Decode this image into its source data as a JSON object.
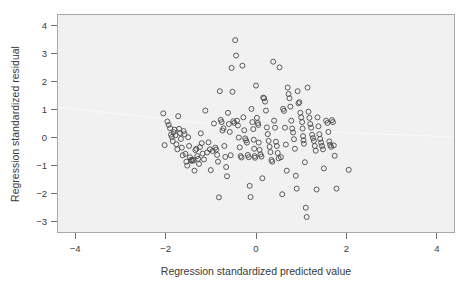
{
  "chart_data": {
    "type": "scatter",
    "title": "",
    "subtitle": "",
    "xlabel": "Regression standardized predicted value",
    "ylabel": "Regression standardized residual",
    "xlim": [
      -4.4,
      4.4
    ],
    "ylim": [
      -3.4,
      4.4
    ],
    "xticks": [
      -4,
      -2,
      0,
      2,
      4
    ],
    "xtick_labels": [
      "−4",
      "−2",
      "0",
      "2",
      "4"
    ],
    "yticks": [
      -3,
      -2,
      -1,
      0,
      1,
      2,
      3,
      4
    ],
    "ytick_labels": [
      "−3",
      "−2",
      "−1",
      "0",
      "1",
      "2",
      "3",
      "4"
    ],
    "grid": false,
    "legend": null,
    "marker": "open-circle",
    "marker_size": 5,
    "plot_background": "#f1f1f1",
    "marker_color": "#4a4a4a",
    "frame_color": "#a8a8a8",
    "n_points": 184,
    "points": [
      [
        -2.05,
        0.86
      ],
      [
        -2.02,
        -0.27
      ],
      [
        -1.96,
        0.57
      ],
      [
        -1.93,
        0.45
      ],
      [
        -1.9,
        0.33
      ],
      [
        -1.88,
        0.1
      ],
      [
        -1.86,
        0.02
      ],
      [
        -1.84,
        -0.13
      ],
      [
        -1.82,
        0.19
      ],
      [
        -1.8,
        0.28
      ],
      [
        -1.78,
        0.08
      ],
      [
        -1.76,
        -0.24
      ],
      [
        -1.74,
        -0.42
      ],
      [
        -1.72,
        0.76
      ],
      [
        -1.7,
        0.31
      ],
      [
        -1.68,
        0.16
      ],
      [
        -1.66,
        -0.05
      ],
      [
        -1.64,
        -0.36
      ],
      [
        -1.62,
        -0.63
      ],
      [
        -1.6,
        0.23
      ],
      [
        -1.58,
        0.12
      ],
      [
        -1.56,
        -0.58
      ],
      [
        -1.54,
        -0.86
      ],
      [
        -1.52,
        -1.0
      ],
      [
        -1.5,
        0.01
      ],
      [
        -1.48,
        -0.3
      ],
      [
        -1.46,
        -0.7
      ],
      [
        -1.44,
        -0.8
      ],
      [
        -1.42,
        -0.83
      ],
      [
        -1.4,
        -0.79
      ],
      [
        -1.38,
        -0.82
      ],
      [
        -1.36,
        -1.18
      ],
      [
        -1.34,
        -0.45
      ],
      [
        -1.32,
        -0.4
      ],
      [
        -1.3,
        -0.66
      ],
      [
        -1.28,
        -0.76
      ],
      [
        -1.26,
        -0.94
      ],
      [
        -1.24,
        -0.34
      ],
      [
        -1.22,
        0.15
      ],
      [
        -1.2,
        -0.2
      ],
      [
        -1.18,
        -0.57
      ],
      [
        -1.15,
        -0.78
      ],
      [
        -1.12,
        0.96
      ],
      [
        -1.08,
        -0.53
      ],
      [
        -1.05,
        -0.17
      ],
      [
        -1.02,
        -0.42
      ],
      [
        -1.0,
        -1.16
      ],
      [
        -0.96,
        -0.48
      ],
      [
        -0.93,
        0.5
      ],
      [
        -0.9,
        -0.36
      ],
      [
        -0.88,
        -0.43
      ],
      [
        -0.86,
        -0.62
      ],
      [
        -0.84,
        -0.86
      ],
      [
        -0.82,
        -2.13
      ],
      [
        -0.8,
        1.65
      ],
      [
        -0.78,
        0.63
      ],
      [
        -0.76,
        0.55
      ],
      [
        -0.74,
        0.25
      ],
      [
        -0.72,
        0.33
      ],
      [
        -0.7,
        -0.3
      ],
      [
        -0.68,
        -0.69
      ],
      [
        -0.66,
        -1.05
      ],
      [
        -0.64,
        -1.38
      ],
      [
        -0.62,
        0.88
      ],
      [
        -0.6,
        0.48
      ],
      [
        -0.58,
        0.2
      ],
      [
        -0.56,
        -0.63
      ],
      [
        -0.54,
        2.48
      ],
      [
        -0.52,
        1.63
      ],
      [
        -0.5,
        0.58
      ],
      [
        -0.48,
        0.52
      ],
      [
        -0.46,
        3.47
      ],
      [
        -0.44,
        2.92
      ],
      [
        -0.42,
        0.6
      ],
      [
        -0.4,
        0.43
      ],
      [
        -0.38,
        0.0
      ],
      [
        -0.36,
        -0.35
      ],
      [
        -0.34,
        -0.66
      ],
      [
        -0.32,
        -0.71
      ],
      [
        -0.3,
        2.56
      ],
      [
        -0.28,
        0.72
      ],
      [
        -0.26,
        0.26
      ],
      [
        -0.24,
        -0.03
      ],
      [
        -0.22,
        -0.1
      ],
      [
        -0.2,
        -0.18
      ],
      [
        -0.18,
        -0.62
      ],
      [
        -0.16,
        -0.7
      ],
      [
        -0.14,
        -1.72
      ],
      [
        -0.12,
        -2.12
      ],
      [
        -0.1,
        1.02
      ],
      [
        -0.08,
        0.55
      ],
      [
        -0.06,
        0.3
      ],
      [
        -0.05,
        -0.08
      ],
      [
        -0.04,
        -0.4
      ],
      [
        -0.03,
        -0.66
      ],
      [
        -0.02,
        -0.72
      ],
      [
        0.0,
        1.85
      ],
      [
        0.02,
        0.7
      ],
      [
        0.04,
        0.52
      ],
      [
        0.05,
        0.45
      ],
      [
        0.06,
        -0.18
      ],
      [
        0.08,
        -0.44
      ],
      [
        0.1,
        -0.6
      ],
      [
        0.12,
        -0.68
      ],
      [
        0.14,
        -1.45
      ],
      [
        0.16,
        1.42
      ],
      [
        0.18,
        1.4
      ],
      [
        0.2,
        1.28
      ],
      [
        0.22,
        0.96
      ],
      [
        0.24,
        0.36
      ],
      [
        0.26,
        0.12
      ],
      [
        0.28,
        -0.12
      ],
      [
        0.3,
        -0.33
      ],
      [
        0.32,
        -0.52
      ],
      [
        0.34,
        -0.8
      ],
      [
        0.36,
        -0.86
      ],
      [
        0.38,
        2.7
      ],
      [
        0.4,
        0.6
      ],
      [
        0.42,
        0.35
      ],
      [
        0.44,
        -0.15
      ],
      [
        0.46,
        -0.3
      ],
      [
        0.48,
        -0.55
      ],
      [
        0.5,
        -0.74
      ],
      [
        0.52,
        2.5
      ],
      [
        0.55,
        -0.7
      ],
      [
        0.58,
        -2.02
      ],
      [
        0.6,
        1.02
      ],
      [
        0.62,
        0.95
      ],
      [
        0.64,
        0.35
      ],
      [
        0.66,
        -0.25
      ],
      [
        0.68,
        -1.18
      ],
      [
        0.7,
        1.78
      ],
      [
        0.72,
        1.55
      ],
      [
        0.74,
        1.4
      ],
      [
        0.76,
        1.1
      ],
      [
        0.78,
        0.6
      ],
      [
        0.8,
        0.32
      ],
      [
        0.82,
        0.18
      ],
      [
        0.84,
        -0.06
      ],
      [
        0.86,
        -0.4
      ],
      [
        0.88,
        -1.36
      ],
      [
        0.9,
        -1.82
      ],
      [
        0.92,
        1.65
      ],
      [
        0.94,
        1.22
      ],
      [
        0.96,
        1.26
      ],
      [
        0.98,
        0.88
      ],
      [
        1.0,
        0.72
      ],
      [
        1.02,
        0.55
      ],
      [
        1.03,
        0.32
      ],
      [
        1.04,
        0.05
      ],
      [
        1.05,
        -0.1
      ],
      [
        1.06,
        -0.22
      ],
      [
        1.08,
        -0.88
      ],
      [
        1.1,
        -2.5
      ],
      [
        1.12,
        -2.83
      ],
      [
        1.14,
        1.78
      ],
      [
        1.16,
        0.92
      ],
      [
        1.18,
        0.7
      ],
      [
        1.2,
        0.48
      ],
      [
        1.22,
        0.35
      ],
      [
        1.24,
        0.1
      ],
      [
        1.26,
        -0.02
      ],
      [
        1.28,
        -0.12
      ],
      [
        1.3,
        -0.3
      ],
      [
        1.32,
        -0.47
      ],
      [
        1.34,
        -1.85
      ],
      [
        1.36,
        0.72
      ],
      [
        1.38,
        0.4
      ],
      [
        1.4,
        0.12
      ],
      [
        1.42,
        -0.05
      ],
      [
        1.44,
        -0.18
      ],
      [
        1.46,
        -0.3
      ],
      [
        1.48,
        -0.42
      ],
      [
        1.5,
        -1.1
      ],
      [
        1.55,
        0.6
      ],
      [
        1.58,
        0.52
      ],
      [
        1.6,
        0.2
      ],
      [
        1.62,
        -0.14
      ],
      [
        1.64,
        -0.26
      ],
      [
        1.66,
        -0.33
      ],
      [
        1.68,
        0.62
      ],
      [
        1.7,
        0.55
      ],
      [
        1.72,
        -0.28
      ],
      [
        1.74,
        -0.65
      ],
      [
        1.78,
        -1.82
      ],
      [
        2.05,
        -1.15
      ]
    ],
    "trend_line": {
      "visible": true,
      "color": "#fafafa",
      "points": [
        [
          -4.4,
          1.08
        ],
        [
          0.0,
          0.3
        ],
        [
          4.4,
          0.02
        ]
      ]
    }
  }
}
